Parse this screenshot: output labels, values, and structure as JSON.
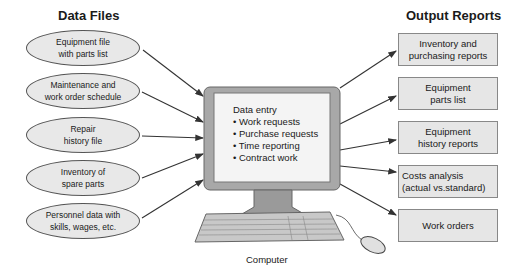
{
  "left_heading": "Data Files",
  "right_heading": "Output Reports",
  "data_files": [
    {
      "line1": "Equipment file",
      "line2": "with parts list"
    },
    {
      "line1": "Maintenance and",
      "line2": "work order schedule"
    },
    {
      "line1": "Repair",
      "line2": "history file"
    },
    {
      "line1": "Inventory of",
      "line2": "spare parts"
    },
    {
      "line1": "Personnel data with",
      "line2": "skills, wages, etc."
    }
  ],
  "computer": {
    "title": "Data entry",
    "items": [
      "• Work requests",
      "• Purchase requests",
      "• Time reporting",
      "• Contract work"
    ],
    "caption": "Computer"
  },
  "output_reports": [
    {
      "line1": "Inventory and",
      "line2": "purchasing reports"
    },
    {
      "line1": "Equipment",
      "line2": "parts list"
    },
    {
      "line1": "Equipment",
      "line2": "history reports"
    },
    {
      "line1": "Costs analysis",
      "line2": "(actual vs.standard)"
    },
    {
      "line1": "Work orders",
      "line2": ""
    }
  ],
  "colors": {
    "shape_fill": "#e6e6e6",
    "monitor_frame": "#9a9a9a",
    "arrow": "#333333"
  }
}
